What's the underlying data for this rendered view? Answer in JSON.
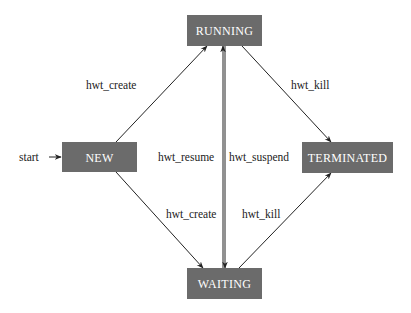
{
  "diagram": {
    "type": "state-machine",
    "colors": {
      "state_fill": "#6b6b6b",
      "state_text": "#ffffff",
      "edge": "#222222",
      "label": "#222222"
    },
    "start": {
      "label": "start",
      "target": "NEW"
    },
    "states": [
      {
        "id": "RUNNING",
        "label": "RUNNING"
      },
      {
        "id": "NEW",
        "label": "NEW"
      },
      {
        "id": "TERMINATED",
        "label": "TERMINATED"
      },
      {
        "id": "WAITING",
        "label": "WAITING"
      }
    ],
    "transitions": [
      {
        "from": "NEW",
        "to": "RUNNING",
        "label": "hwt_create"
      },
      {
        "from": "RUNNING",
        "to": "TERMINATED",
        "label": "hwt_kill"
      },
      {
        "from": "WAITING",
        "to": "RUNNING",
        "label": "hwt_resume"
      },
      {
        "from": "RUNNING",
        "to": "WAITING",
        "label": "hwt_suspend"
      },
      {
        "from": "NEW",
        "to": "WAITING",
        "label": "hwt_create"
      },
      {
        "from": "WAITING",
        "to": "TERMINATED",
        "label": "hwt_kill"
      }
    ]
  }
}
